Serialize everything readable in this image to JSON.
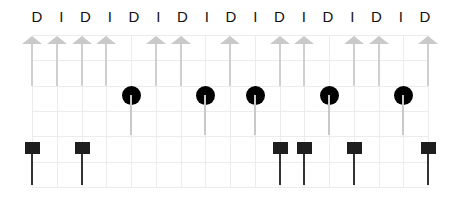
{
  "labels": [
    "D",
    "I",
    "D",
    "I",
    "D",
    "I",
    "D",
    "I",
    "D",
    "I",
    "D",
    "I",
    "D",
    "I",
    "D",
    "I",
    "D"
  ],
  "grid": {
    "columns": 17,
    "col_x": [
      32,
      56.75,
      81.5,
      106.25,
      131,
      155.75,
      180.5,
      205.25,
      230,
      254.75,
      279.5,
      304.25,
      329,
      353.75,
      378.5,
      403.25,
      428
    ],
    "label_x": [
      37,
      61.25,
      85.5,
      109.75,
      134,
      158.25,
      182.5,
      206.75,
      231,
      255.25,
      279.5,
      303.75,
      328,
      352.25,
      376.5,
      400.75,
      425
    ],
    "row_y": [
      35,
      60,
      86,
      111,
      136,
      162,
      187
    ],
    "color": "#ececec"
  },
  "rows": {
    "arrows": {
      "marker": "up-arrow",
      "color": "#c9c9c9",
      "columns": [
        0,
        1,
        2,
        3,
        5,
        6,
        8,
        10,
        11,
        13,
        14,
        16
      ]
    },
    "circles": {
      "marker": "filled-circle",
      "color": "#000000",
      "stem_color": "#c9c9c9",
      "columns": [
        4,
        7,
        9,
        12,
        15
      ]
    },
    "squares": {
      "marker": "filled-square",
      "color": "#1e1e1e",
      "stem_color": "#333333",
      "columns": [
        0,
        2,
        10,
        11,
        13,
        16
      ]
    }
  }
}
